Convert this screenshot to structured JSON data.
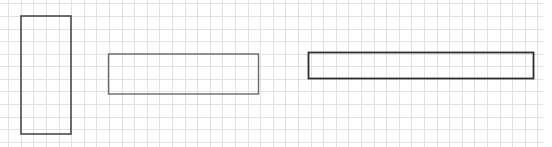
{
  "diagram": {
    "type": "grid-with-rectangles",
    "background": "#ffffff",
    "grid": {
      "spacing": 12.6,
      "offset_x": 8.2,
      "offset_y": 3.3,
      "extent_x": 543,
      "extent_y": 147,
      "line_color": "#e2e2e2",
      "line_width": 1
    },
    "shapes": [
      {
        "id": "rect-tall",
        "label": "Tall rectangle",
        "x": 21,
        "y": 16,
        "width": 50,
        "height": 118,
        "stroke": "#4a4a4a",
        "stroke_width": 1.6
      },
      {
        "id": "rect-wide",
        "label": "Wide rectangle",
        "x": 108.5,
        "y": 54,
        "width": 150,
        "height": 40,
        "stroke": "#6a6a6a",
        "stroke_width": 1.4
      },
      {
        "id": "rect-long",
        "label": "Long thin rectangle",
        "x": 308.5,
        "y": 52.5,
        "width": 225,
        "height": 26,
        "stroke": "#2e2e2e",
        "stroke_width": 1.8
      }
    ]
  }
}
